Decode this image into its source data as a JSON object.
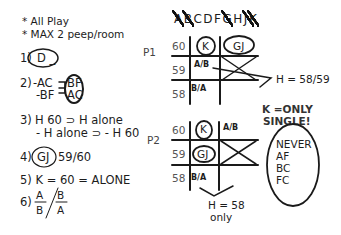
{
  "rules": {
    "r0a": "* All Play",
    "r0b": "* MAX 2 peep/room",
    "r1_num": "1)",
    "r1_text": "D _",
    "r2_num": "2)",
    "r2_a": "-AC",
    "r2_b": "-BF",
    "r2_c": "BF",
    "r2_d": "AC",
    "r3_num": "3)",
    "r3_a": "H 60  ⊃  H alone",
    "r3_b": "- H alone  ⊃  - H 60",
    "r4_num": "4)",
    "r4_circ": "GJ",
    "r4_text": "59/60",
    "r5": "5) K = 60 = ALONE",
    "r6_num": "6)",
    "r6_n1": "A",
    "r6_d1": "B",
    "r6_n2": "B",
    "r6_d2": "A"
  },
  "header": {
    "letters": [
      {
        "l": "A",
        "crossed": true
      },
      {
        "l": "B",
        "crossed": true
      },
      {
        "l": "C",
        "crossed": false
      },
      {
        "l": "D",
        "crossed": false
      },
      {
        "l": "F",
        "crossed": false
      },
      {
        "l": "G",
        "crossed": true
      },
      {
        "l": "H",
        "crossed": false
      },
      {
        "l": "J",
        "crossed": true
      },
      {
        "l": "K",
        "crossed": true
      }
    ]
  },
  "p1": {
    "label": "P1",
    "rows": [
      "60",
      "59",
      "58"
    ],
    "k": "K",
    "gj": "GJ",
    "ab": "A/B",
    "ba": "B/A",
    "note": "H = 58/59"
  },
  "p2": {
    "label": "P2",
    "rows": [
      "60",
      "59",
      "58"
    ],
    "k": "K",
    "gj": "GJ",
    "ab": "A/B",
    "ba": "B/A",
    "note1": "H = 58",
    "note2": "only"
  },
  "side": {
    "k1": "K =ONLY",
    "k2": "SINGLE!",
    "never": "NEVER",
    "pairs": [
      "AF",
      "BC",
      "FC"
    ]
  }
}
